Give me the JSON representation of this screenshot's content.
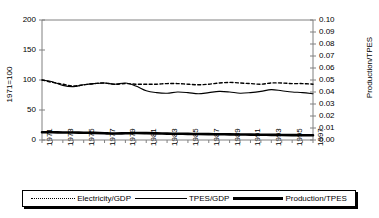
{
  "chart_data": {
    "type": "line",
    "title": "",
    "xlabel": "",
    "ylabel": "1971=100",
    "ylabel_right": "Production/TPES",
    "ylim": [
      0,
      200
    ],
    "ylim_right": [
      0.0,
      0.1
    ],
    "yticks": [
      "0",
      "50",
      "100",
      "150",
      "200"
    ],
    "yticks_right": [
      "0.00",
      "0.01",
      "0.02",
      "0.03",
      "0.04",
      "0.05",
      "0.06",
      "0.07",
      "0.08",
      "0.09",
      "0.10"
    ],
    "grid": false,
    "legend_position": "bottom",
    "x": [
      1971,
      1972,
      1973,
      1974,
      1975,
      1976,
      1977,
      1978,
      1979,
      1980,
      1981,
      1982,
      1983,
      1984,
      1985,
      1986,
      1987,
      1988,
      1989,
      1990,
      1991,
      1992,
      1993,
      1994,
      1995,
      1996,
      1997
    ],
    "xticks": [
      "1971",
      "1973",
      "1975",
      "1977",
      "1979",
      "1981",
      "1983",
      "1985",
      "1987",
      "1989",
      "1991",
      "1993",
      "1995",
      "1997"
    ],
    "series": [
      {
        "name": "Electricity/GDP",
        "style": "dotted",
        "axis": "left",
        "values": [
          100,
          96,
          93,
          90,
          92,
          94,
          95,
          93,
          94,
          93,
          93,
          93,
          94,
          94,
          93,
          92,
          93,
          95,
          96,
          95,
          94,
          93,
          95,
          95,
          94,
          94,
          93
        ]
      },
      {
        "name": "TPES/GDP",
        "style": "solid-thin",
        "axis": "left",
        "values": [
          100,
          97,
          91,
          89,
          92,
          94,
          95,
          93,
          95,
          90,
          82,
          79,
          78,
          80,
          79,
          77,
          79,
          81,
          80,
          78,
          79,
          81,
          84,
          82,
          80,
          79,
          77
        ]
      },
      {
        "name": "Production/TPES",
        "style": "solid-thick",
        "axis": "right",
        "values": [
          0.0065,
          0.0064,
          0.0063,
          0.0062,
          0.0061,
          0.0059,
          0.0056,
          0.0054,
          0.0056,
          0.0058,
          0.0057,
          0.0055,
          0.0053,
          0.0052,
          0.0051,
          0.005,
          0.0049,
          0.0048,
          0.0047,
          0.0046,
          0.0045,
          0.0044,
          0.0043,
          0.0042,
          0.0041,
          0.004,
          0.0039
        ]
      }
    ]
  },
  "legend": {
    "items": [
      {
        "label": "Electricity/GDP",
        "style": "dotted"
      },
      {
        "label": "TPES/GDP",
        "style": "solid-thin"
      },
      {
        "label": "Production/TPES",
        "style": "solid-thick"
      }
    ]
  }
}
